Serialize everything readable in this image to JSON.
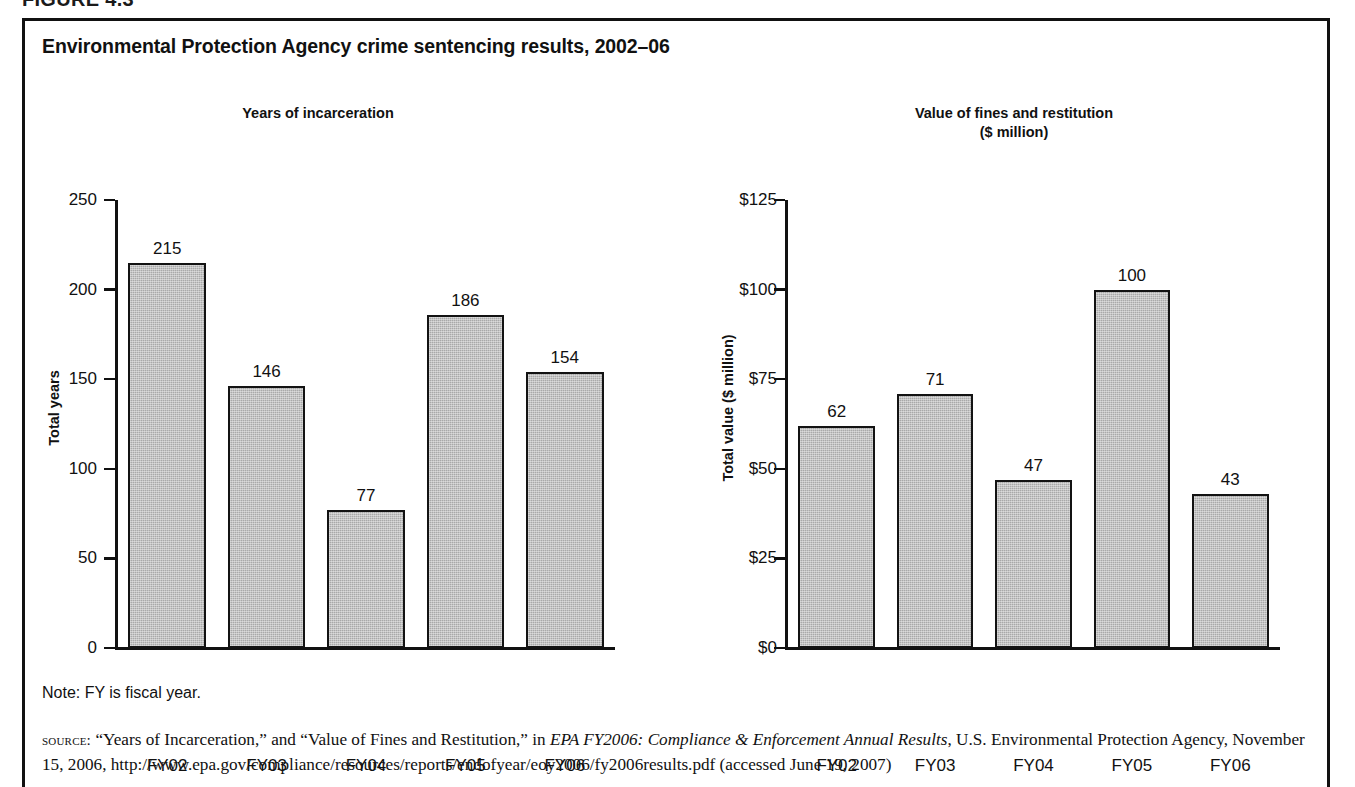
{
  "figure": {
    "number_label": "FIGURE 4.3",
    "title": "Environmental Protection Agency crime sentencing results, 2002–06",
    "note": "Note:  FY is fiscal year.",
    "source": {
      "prefix": "source:",
      "text_before_italic": " “Years of Incarceration,” and “Value of Fines and Restitution,” in ",
      "italic_title": "EPA FY2006: Compliance & Enforcement Annual Results",
      "text_after_italic": ", U.S. Environmental Protection Agency, November 15, 2006, http://www.epa.gov/compliance/resources/reports/endofyear/eoy2006/fy2006results.pdf (accessed June 19, 2007)"
    }
  },
  "chart_data": [
    {
      "type": "bar",
      "title": "Years of incarceration",
      "xlabel": "",
      "ylabel": "Total years",
      "categories": [
        "FY02",
        "FY03",
        "FY04",
        "FY05",
        "FY06"
      ],
      "values": [
        215,
        146,
        77,
        186,
        154
      ],
      "value_labels": [
        "215",
        "146",
        "77",
        "186",
        "154"
      ],
      "ylim": [
        0,
        250
      ],
      "yticks": [
        0,
        50,
        100,
        150,
        200,
        250
      ],
      "ytick_labels": [
        "0",
        "50",
        "100",
        "150",
        "200",
        "250"
      ],
      "grid": false,
      "legend": "none",
      "bar_color": "#a9a9a9",
      "bar_edge_color": "#131313"
    },
    {
      "type": "bar",
      "title": "Value of fines and restitution\n($ million)",
      "title_line1": "Value of fines and restitution",
      "title_line2": "($ million)",
      "xlabel": "",
      "ylabel": "Total value ($ million)",
      "categories": [
        "FY02",
        "FY03",
        "FY04",
        "FY05",
        "FY06"
      ],
      "values": [
        62,
        71,
        47,
        100,
        43
      ],
      "value_labels": [
        "62",
        "71",
        "47",
        "100",
        "43"
      ],
      "ylim": [
        0,
        125
      ],
      "yticks": [
        0,
        25,
        50,
        75,
        100,
        125
      ],
      "ytick_labels": [
        "$0",
        "$25",
        "$50",
        "$75",
        "$100",
        "$125"
      ],
      "grid": false,
      "legend": "none",
      "bar_color": "#a9a9a9",
      "bar_edge_color": "#131313"
    }
  ]
}
